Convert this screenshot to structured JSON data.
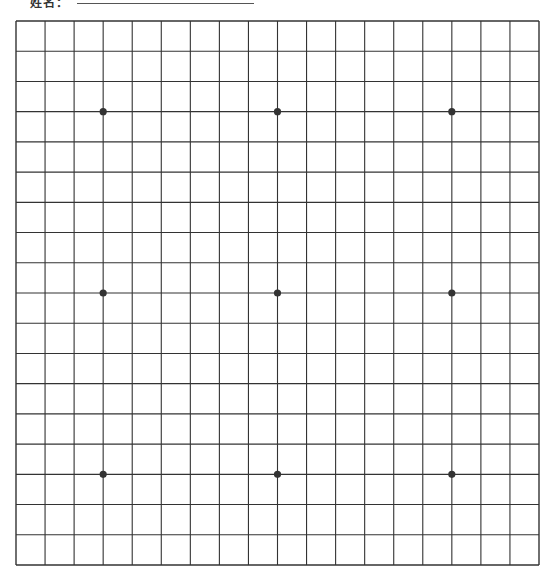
{
  "header": {
    "label_clipped": "姓名：",
    "fill_line": true
  },
  "board": {
    "size": 19,
    "left": 16,
    "top": 21,
    "right": 539,
    "bottom": 565,
    "line_color": "#333333",
    "star_color": "#333333",
    "star_points": [
      [
        3,
        3
      ],
      [
        9,
        3
      ],
      [
        15,
        3
      ],
      [
        3,
        9
      ],
      [
        9,
        9
      ],
      [
        15,
        9
      ],
      [
        3,
        15
      ],
      [
        9,
        15
      ],
      [
        15,
        15
      ]
    ],
    "stones": []
  }
}
